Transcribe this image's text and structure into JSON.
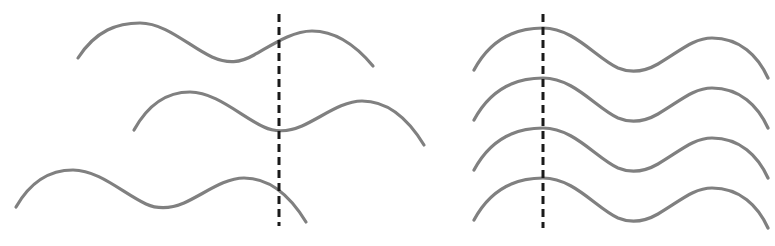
{
  "figure": {
    "title": "",
    "clipped_caption_text": "",
    "background_color": "#ffffff",
    "width": 775,
    "height": 246
  },
  "style": {
    "wave_stroke_color": "#808080",
    "wave_stroke_width": 3.2,
    "align_line_color": "#1a1a1a",
    "align_line_width": 3,
    "align_line_dash": "8 5"
  },
  "panels": [
    {
      "id": "left-panel",
      "name": "unaligned-waveforms",
      "curve_count": 3,
      "align_line": {
        "x": 279,
        "y_top": 14,
        "y_bottom": 226
      }
    },
    {
      "id": "right-panel",
      "name": "aligned-waveforms",
      "curve_count": 4,
      "align_line": {
        "x": 543,
        "y_top": 14,
        "y_bottom": 228
      }
    }
  ],
  "chart_data": {
    "type": "line",
    "title": "",
    "xlabel": "",
    "ylabel": "",
    "xlim": [
      0,
      775
    ],
    "ylim": [
      246,
      0
    ],
    "grid": false,
    "legend": null,
    "annotations": [
      {
        "name": "left-alignment-line",
        "type": "vertical-dashed-line",
        "x": 279,
        "y_start": 14,
        "y_end": 226,
        "color": "#1a1a1a"
      },
      {
        "name": "right-alignment-line",
        "type": "vertical-dashed-line",
        "x": 543,
        "y_start": 14,
        "y_end": 228,
        "color": "#1a1a1a"
      }
    ],
    "series": [
      {
        "name": "left-curve-1",
        "panel": "left-panel",
        "color": "#808080",
        "x_start": 78,
        "x_end": 373,
        "path": "M 78,58 C 96,30 118,23 140,23 C 166,23 190,47 212,57 C 228,64 240,63 254,55 C 272,45 292,31 312,31 C 338,31 358,48 373,66"
      },
      {
        "name": "left-curve-2",
        "panel": "left-panel",
        "color": "#808080",
        "x_start": 134,
        "x_end": 424,
        "path": "M 134,130 C 150,101 170,92 190,92 C 216,92 242,117 264,127 C 274,132 288,132 302,126 C 322,117 342,101 362,101 C 390,101 410,122 424,145"
      },
      {
        "name": "left-curve-3",
        "panel": "left-panel",
        "color": "#808080",
        "x_start": 16,
        "x_end": 306,
        "path": "M 16,207 C 32,179 52,170 73,170 C 99,170 124,194 146,204 C 157,209 170,209 184,203 C 204,194 224,178 244,178 C 272,178 292,199 306,222"
      },
      {
        "name": "right-curve-1",
        "panel": "right-panel",
        "color": "#808080",
        "x_start": 474,
        "x_end": 768,
        "path": "M 474,70 C 490,40 514,28 543,28 C 574,28 596,58 618,68 C 630,73 644,72 658,64 C 680,51 694,38 712,38 C 740,38 758,56 768,78"
      },
      {
        "name": "right-curve-2",
        "panel": "right-panel",
        "color": "#808080",
        "x_start": 474,
        "x_end": 768,
        "path": "M 474,120 C 490,90 514,78 543,78 C 574,78 596,108 618,118 C 630,123 644,122 658,114 C 680,101 694,88 712,88 C 740,88 758,106 768,128"
      },
      {
        "name": "right-curve-3",
        "panel": "right-panel",
        "color": "#808080",
        "x_start": 474,
        "x_end": 768,
        "path": "M 474,170 C 490,140 514,128 543,128 C 574,128 596,158 618,168 C 630,173 644,172 658,164 C 680,151 694,138 712,138 C 740,138 758,156 768,178"
      },
      {
        "name": "right-curve-4",
        "panel": "right-panel",
        "color": "#808080",
        "x_start": 474,
        "x_end": 768,
        "path": "M 474,220 C 490,190 514,178 543,178 C 574,178 596,208 618,218 C 630,223 644,222 658,214 C 680,201 694,188 712,188 C 740,188 758,206 768,228"
      }
    ]
  }
}
